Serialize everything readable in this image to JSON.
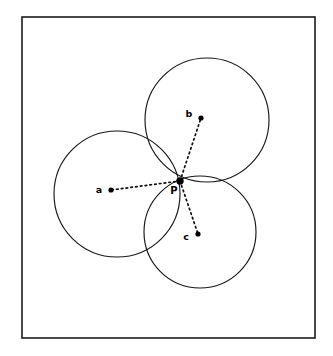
{
  "figure": {
    "background_color": "#ffffff",
    "stroke_color": "#181818",
    "frame": {
      "x": 22,
      "y": 17,
      "width": 293,
      "height": 321,
      "stroke_color": "#1c1c1c"
    }
  },
  "chart_data": {
    "type": "scatter",
    "xlabel": "",
    "ylabel": "",
    "grid": false,
    "legend": "none",
    "xlim": [
      22,
      315
    ],
    "ylim": [
      17,
      338
    ],
    "circles": [
      {
        "name": "circle-a",
        "center_label": "a",
        "cx": 117,
        "cy": 194,
        "r": 63
      },
      {
        "name": "circle-b",
        "center_label": "b",
        "cx": 207,
        "cy": 120,
        "r": 62
      },
      {
        "name": "circle-c",
        "center_label": "c",
        "cx": 200,
        "cy": 232,
        "r": 56
      }
    ],
    "points": [
      {
        "label": "a",
        "x": 111,
        "y": 190,
        "label_x": 99,
        "label_y": 193,
        "radius": 2.6
      },
      {
        "label": "b",
        "x": 201,
        "y": 118,
        "label_x": 189,
        "label_y": 117,
        "radius": 2.6
      },
      {
        "label": "c",
        "x": 198,
        "y": 234,
        "label_x": 186,
        "label_y": 240,
        "radius": 2.6
      },
      {
        "label": "P",
        "x": 180,
        "y": 181,
        "label_x": 174,
        "label_y": 194,
        "radius": 3.1
      }
    ],
    "connectors": [
      {
        "name": "p-to-a",
        "x1": 180,
        "y1": 181,
        "x2": 111,
        "y2": 190
      },
      {
        "name": "p-to-b",
        "x1": 180,
        "y1": 181,
        "x2": 201,
        "y2": 118
      },
      {
        "name": "p-to-c",
        "x1": 180,
        "y1": 181,
        "x2": 198,
        "y2": 234
      }
    ]
  },
  "labels": {
    "a": "a",
    "b": "b",
    "c": "c",
    "p": "P"
  }
}
